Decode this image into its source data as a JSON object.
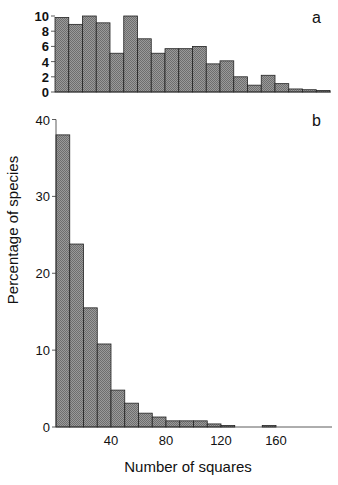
{
  "chart_data": [
    {
      "panel": "a",
      "type": "bar",
      "bin_width": 10,
      "x_start": 0,
      "categories": [
        "0-10",
        "10-20",
        "20-30",
        "30-40",
        "40-50",
        "50-60",
        "60-70",
        "70-80",
        "80-90",
        "90-100",
        "100-110",
        "110-120",
        "120-130",
        "130-140",
        "140-150",
        "150-160",
        "160-170",
        "170-180",
        "180-190",
        "190-200"
      ],
      "values": [
        9.8,
        8.9,
        10.0,
        9.1,
        5.1,
        10.0,
        7.0,
        5.1,
        5.7,
        5.7,
        6.0,
        3.7,
        4.1,
        2.0,
        0.9,
        2.2,
        1.1,
        0.4,
        0.3,
        0.2
      ],
      "ylim": [
        0,
        10
      ],
      "yticks": [
        0,
        2,
        4,
        6,
        8,
        10
      ],
      "xlabel": "",
      "ylabel": "",
      "grid": false
    },
    {
      "panel": "b",
      "type": "bar",
      "bin_width": 10,
      "x_start": 0,
      "categories": [
        "0-10",
        "10-20",
        "20-30",
        "30-40",
        "40-50",
        "50-60",
        "60-70",
        "70-80",
        "80-90",
        "90-100",
        "100-110",
        "110-120",
        "120-130",
        "130-140",
        "140-150",
        "150-160",
        "160-170",
        "170-180",
        "180-190",
        "190-200"
      ],
      "values": [
        38.0,
        23.8,
        15.5,
        10.8,
        4.8,
        3.1,
        1.8,
        1.3,
        0.8,
        0.8,
        0.8,
        0.4,
        0.2,
        0,
        0,
        0.2,
        0,
        0,
        0,
        0
      ],
      "ylim": [
        0,
        40
      ],
      "yticks": [
        0,
        10,
        20,
        30,
        40
      ],
      "xticks": [
        40,
        80,
        120,
        160
      ],
      "xlabel": "Number of squares",
      "ylabel": "Percentage of species",
      "grid": false
    }
  ],
  "labels": {
    "panel_a": "a",
    "panel_b": "b",
    "ylabel": "Percentage of species",
    "xlabel": "Number of squares"
  },
  "colors": {
    "bar_fill": "#8a8a8a",
    "bar_edge": "#222222",
    "axis": "#333333"
  }
}
